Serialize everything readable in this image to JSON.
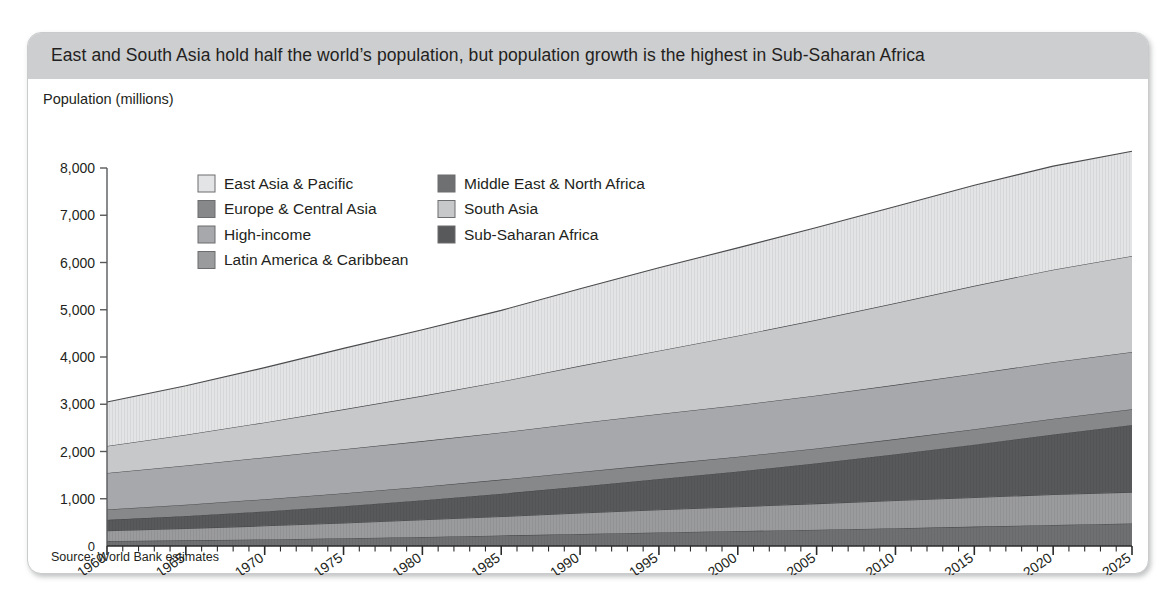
{
  "card": {
    "title": "East and South Asia hold half the world’s population, but population growth is the highest in Sub-Saharan Africa",
    "source": "Source: World Bank estimates",
    "title_bar_color": "#cdced0",
    "border_color": "#c9cbcd",
    "background_color": "#ffffff"
  },
  "chart_data": {
    "type": "area",
    "stacked": true,
    "title": "East and South Asia hold half the world’s population, but population growth is the highest in Sub-Saharan Africa",
    "subtitle": "",
    "xlabel": "",
    "ylabel": "Population (millions)",
    "axis_title": "Population (millions)",
    "source_note": "Source: World Bank estimates",
    "xlim": [
      1960,
      2025
    ],
    "ylim": [
      0,
      8000
    ],
    "ytick_values": [
      0,
      1000,
      2000,
      3000,
      4000,
      5000,
      6000,
      7000,
      8000
    ],
    "ytick_labels": [
      "0",
      "1,000",
      "2,000",
      "3,000",
      "4,000",
      "5,000",
      "6,000",
      "7,000",
      "8,000"
    ],
    "xtick_labels": [
      "1960",
      "1965",
      "1970",
      "1975",
      "1980",
      "1985",
      "1990",
      "1995",
      "2000",
      "2005",
      "2010",
      "2015",
      "2020",
      "2025"
    ],
    "xtick_values": [
      1960,
      1965,
      1970,
      1975,
      1980,
      1985,
      1990,
      1995,
      2000,
      2005,
      2010,
      2015,
      2020,
      2025
    ],
    "minor_xtick_interval": 1,
    "xtick_label_rotation": -35,
    "grid": false,
    "legend_position": "inside-top-left",
    "legend_columns": 2,
    "x": [
      1960,
      1965,
      1970,
      1975,
      1980,
      1985,
      1990,
      1995,
      2000,
      2005,
      2010,
      2015,
      2020,
      2025
    ],
    "stack_order_bottom_to_top": [
      "Middle East & North Africa",
      "Latin America & Caribbean",
      "Sub-Saharan Africa",
      "Europe & Central Asia",
      "High-income",
      "South Asia",
      "East Asia & Pacific"
    ],
    "series": [
      {
        "name": "Middle East & North Africa",
        "color": "#6f7072",
        "hatch": "vertical-lines",
        "values": [
          105,
          120,
          140,
          163,
          191,
          222,
          256,
          288,
          316,
          345,
          377,
          411,
          447,
          478
        ]
      },
      {
        "name": "Latin America & Caribbean",
        "color": "#9a9b9d",
        "hatch": "vertical-lines",
        "values": [
          220,
          252,
          287,
          325,
          363,
          402,
          441,
          479,
          516,
          552,
          586,
          617,
          644,
          663
        ]
      },
      {
        "name": "Sub-Saharan Africa",
        "color": "#58595b",
        "hatch": "vertical-lines",
        "values": [
          228,
          263,
          305,
          355,
          414,
          483,
          563,
          650,
          745,
          855,
          979,
          1117,
          1269,
          1420
        ]
      },
      {
        "name": "Europe & Central Asia",
        "color": "#87888a",
        "hatch": "none",
        "values": [
          222,
          240,
          258,
          274,
          287,
          298,
          308,
          311,
          311,
          314,
          320,
          327,
          333,
          335
        ]
      },
      {
        "name": "High-income",
        "color": "#a6a8ab",
        "hatch": "none",
        "values": [
          770,
          830,
          885,
          930,
          965,
          997,
          1035,
          1065,
          1092,
          1120,
          1149,
          1174,
          1196,
          1210
        ]
      },
      {
        "name": "South Asia",
        "color": "#c7c8ca",
        "hatch": "none",
        "values": [
          572,
          650,
          740,
          845,
          958,
          1080,
          1210,
          1340,
          1470,
          1600,
          1730,
          1860,
          1960,
          2030
        ]
      },
      {
        "name": "East Asia & Pacific",
        "color": "#e3e4e5",
        "hatch": "vertical-lines",
        "values": [
          930,
          1035,
          1160,
          1290,
          1400,
          1505,
          1630,
          1755,
          1860,
          1955,
          2045,
          2130,
          2190,
          2220
        ]
      }
    ],
    "stacked_totals": [
      3047,
      3390,
      3775,
      4182,
      4578,
      4987,
      5443,
      5888,
      6310,
      6741,
      7186,
      7636,
      8039,
      8356
    ],
    "legend": [
      {
        "label": "East Asia & Pacific",
        "color": "#e3e4e5"
      },
      {
        "label": "Middle East & North Africa",
        "color": "#6f7072"
      },
      {
        "label": "Europe & Central Asia",
        "color": "#87888a"
      },
      {
        "label": "South Asia",
        "color": "#c7c8ca"
      },
      {
        "label": "High-income",
        "color": "#a6a8ab"
      },
      {
        "label": "Sub-Saharan Africa",
        "color": "#58595b"
      },
      {
        "label": "Latin America & Caribbean",
        "color": "#9a9b9d"
      }
    ]
  }
}
